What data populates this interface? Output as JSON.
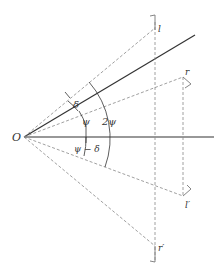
{
  "diagram": {
    "origin_label": "O",
    "points": {
      "l": "l",
      "r": "r",
      "l_prime": "l′",
      "r_prime": "r′"
    },
    "angles": {
      "delta": "δ",
      "psi": "ψ",
      "two_psi": "2ψ",
      "psi_minus_delta": "ψ − δ"
    },
    "colors": {
      "solid_line": "#333333",
      "dashed_line": "#888888",
      "text": "#333333"
    }
  }
}
